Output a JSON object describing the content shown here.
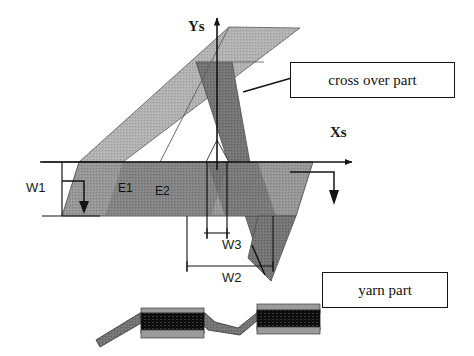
{
  "figure": {
    "type": "technical-diagram",
    "background_color": "#ffffff",
    "line_color": "#141414"
  },
  "axes": {
    "x_label": "Xs",
    "y_label": "Ys",
    "origin_note": "crossing point of the two diagonal bands"
  },
  "callouts": [
    {
      "id": "cross-over",
      "label": "cross over part"
    },
    {
      "id": "yarn",
      "label": "yarn part"
    }
  ],
  "dimensions": [
    {
      "id": "w1",
      "label": "W1",
      "orientation": "vertical",
      "measures": "horizontal band thickness"
    },
    {
      "id": "w2",
      "label": "W2",
      "orientation": "horizontal",
      "measures": "outer crossover span"
    },
    {
      "id": "w3",
      "label": "W3",
      "orientation": "horizontal",
      "measures": "inner crossover span"
    }
  ],
  "elements": [
    {
      "id": "e1",
      "label": "E1"
    },
    {
      "id": "e2",
      "label": "E2"
    }
  ],
  "colors": {
    "band_light": "#a8a8a8",
    "band_mid": "#8f8f8f",
    "band_dark": "#6e6e6e",
    "band_darker": "#616161",
    "section_block": "#101010",
    "section_strip": "#7d7d7d",
    "outline": "#141414"
  },
  "cross_section": {
    "description": "side view of zigzag yarn strip with two dark blocks",
    "block_count": 2
  }
}
